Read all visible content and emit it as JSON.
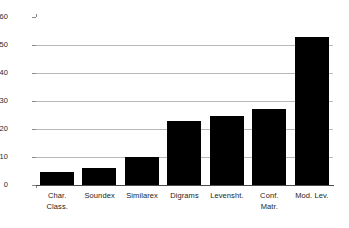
{
  "chart_data": {
    "type": "bar",
    "title": "",
    "subtitle": "",
    "xlabel": "",
    "ylabel": "",
    "categories": [
      "Char. Class.",
      "Soundex",
      "Similarex",
      "Digrams",
      "Levensht.",
      "Conf. Matr.",
      "Mod. Lev."
    ],
    "category_lines": [
      [
        "Char.",
        "Class."
      ],
      [
        "Soundex",
        ""
      ],
      [
        "Similarex",
        ""
      ],
      [
        "Digrams",
        ""
      ],
      [
        "Levensht.",
        ""
      ],
      [
        "Conf.",
        "Matr."
      ],
      [
        "Mod. Lev.",
        ""
      ]
    ],
    "values": [
      4.5,
      6,
      10,
      23,
      24.5,
      27,
      53
    ],
    "series": [
      {
        "name": "",
        "values": [
          4.5,
          6,
          10,
          23,
          24.5,
          27,
          53
        ]
      }
    ],
    "ylim": [
      0,
      60
    ],
    "xlim": [
      0,
      7
    ],
    "y_ticks": [
      0,
      10,
      20,
      30,
      40,
      50,
      60
    ],
    "y_tick_labels": [
      "0",
      "10",
      "20",
      "30",
      "40",
      "50",
      "60"
    ],
    "grid": true,
    "grid_axis": "y",
    "legend": false,
    "legend_position": "none",
    "bar_color": "#000000",
    "grid_color": "#b8b8b8",
    "axis_color": "#4a4a4a",
    "background_color": "#ffffff",
    "annotations": []
  }
}
